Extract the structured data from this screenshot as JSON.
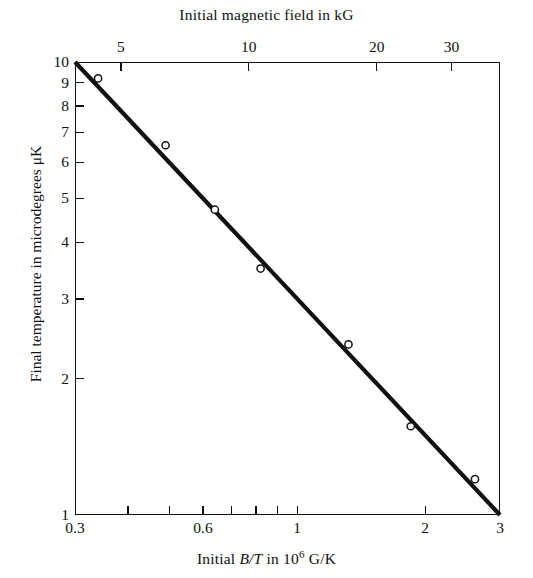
{
  "figure": {
    "top_axis_title": "Initial magnetic field in kG",
    "bottom_axis_title_prefix": "Initial ",
    "bottom_axis_title_italic": "B/T",
    "bottom_axis_title_mid": " in 10",
    "bottom_axis_title_exp": "6",
    "bottom_axis_title_suffix": " G/K",
    "y_axis_title": "Final temperature in microdegrees μK",
    "line_color": "#111111",
    "marker_color": "#ffffff",
    "axis_color": "#111111"
  },
  "chart_data": {
    "type": "scatter",
    "title": "",
    "xlabel": "Initial B/T in 10^6 G/K",
    "ylabel": "Final temperature in microdegrees µK",
    "x2label": "Initial magnetic field in kG",
    "xscale": "log",
    "yscale": "log",
    "xlim": [
      0.3,
      3
    ],
    "ylim": [
      1,
      10
    ],
    "x2lim": [
      3.9,
      39
    ],
    "grid": false,
    "legend": null,
    "x_ticklabels": [
      "0.3",
      "0.6",
      "1",
      "2",
      "3"
    ],
    "x_tickvalues": [
      0.3,
      0.6,
      1,
      2,
      3
    ],
    "x_minor_tickvalues": [
      0.4,
      0.5,
      0.6,
      0.7,
      0.8,
      0.9,
      1,
      2
    ],
    "y_ticklabels": [
      "10",
      "9",
      "8",
      "7",
      "6",
      "5",
      "4",
      "3",
      "2",
      "1"
    ],
    "y_tickvalues": [
      10,
      9,
      8,
      7,
      6,
      5,
      4,
      3,
      2,
      1
    ],
    "x2_ticklabels": [
      "5",
      "10",
      "20",
      "30"
    ],
    "x2_tickvalues": [
      5,
      10,
      20,
      30
    ],
    "series": [
      {
        "name": "measured final temperature",
        "marker": "open-circle",
        "points": [
          {
            "x": 0.34,
            "y": 9.2
          },
          {
            "x": 0.49,
            "y": 6.55
          },
          {
            "x": 0.64,
            "y": 4.72
          },
          {
            "x": 0.82,
            "y": 3.5
          },
          {
            "x": 1.32,
            "y": 2.38
          },
          {
            "x": 1.85,
            "y": 1.57
          },
          {
            "x": 2.62,
            "y": 1.2
          }
        ]
      },
      {
        "name": "fitted straight line",
        "marker": "none",
        "points": [
          {
            "x": 0.3,
            "y": 10.0
          },
          {
            "x": 3.0,
            "y": 1.0
          }
        ]
      }
    ]
  }
}
